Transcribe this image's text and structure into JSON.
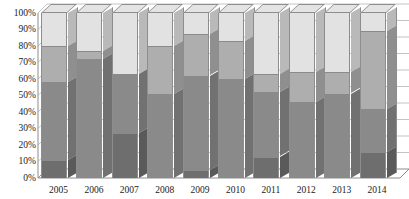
{
  "chart_data": {
    "type": "bar",
    "subtype": "stacked-bar-100-percent-3d",
    "title": "",
    "subtitle": "",
    "xlabel": "",
    "ylabel": "",
    "grid": true,
    "legend_position": "none",
    "ylim": [
      0,
      100
    ],
    "y_tick_labels": [
      "0%",
      "10%",
      "20%",
      "30%",
      "40%",
      "50%",
      "60%",
      "70%",
      "80%",
      "90%",
      "100%"
    ],
    "y_tick_values": [
      0,
      10,
      20,
      30,
      40,
      50,
      60,
      70,
      80,
      90,
      100
    ],
    "categories": [
      "2005",
      "2006",
      "2007",
      "2008",
      "2009",
      "2010",
      "2011",
      "2012",
      "2013",
      "2014"
    ],
    "series": [
      {
        "name": "Series 1",
        "color": "#6e6e6e",
        "values": [
          11,
          0,
          27,
          0,
          5,
          0,
          13,
          0,
          0,
          16
        ]
      },
      {
        "name": "Series 2",
        "color": "#8a8a8a",
        "values": [
          47,
          72,
          36,
          51,
          57,
          60,
          39,
          46,
          51,
          26
        ]
      },
      {
        "name": "Series 3",
        "color": "#aeaeae",
        "values": [
          22,
          5,
          0,
          29,
          25,
          23,
          11,
          18,
          13,
          47
        ]
      },
      {
        "name": "Series 4",
        "color": "#e2e2e2",
        "values": [
          20,
          23,
          37,
          20,
          13,
          17,
          37,
          36,
          36,
          11
        ]
      }
    ],
    "stack_order": "bottom-to-top",
    "bar_totals": [
      100,
      100,
      100,
      100,
      100,
      100,
      100,
      100,
      100,
      100
    ],
    "colors": {
      "segment_1": "#6e6e6e",
      "segment_2": "#8a8a8a",
      "segment_3": "#aeaeae",
      "segment_4": "#e2e2e2",
      "outline": "#8d8d8d",
      "gridline": "#b5b5b5",
      "axis": "#8d8d8d",
      "text": "#1a1a1a",
      "background": "#ffffff"
    }
  }
}
